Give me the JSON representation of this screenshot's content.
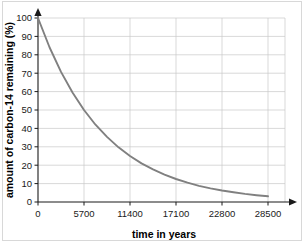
{
  "figure": {
    "background_color": "#ffffff",
    "frame_color": "#d8d8d8"
  },
  "chart_data": {
    "type": "line",
    "title": "",
    "subtitle": "",
    "xlabel": "time in years",
    "ylabel": "amount of carbon-14 remaining (%)",
    "xlim": [
      0,
      28500
    ],
    "ylim": [
      0,
      100
    ],
    "xticks": [
      0,
      5700,
      11400,
      17100,
      22800,
      28500
    ],
    "xtick_labels": [
      "0",
      "5700",
      "11400",
      "17100",
      "22800",
      "28500"
    ],
    "yticks": [
      0,
      10,
      20,
      30,
      40,
      50,
      60,
      70,
      80,
      90,
      100
    ],
    "ytick_labels": [
      "0",
      "10",
      "20",
      "30",
      "40",
      "50",
      "60",
      "70",
      "80",
      "90",
      "100"
    ],
    "grid": true,
    "grid_color": "#c9c9c9",
    "legend": false,
    "legend_position": "none",
    "series": [
      {
        "name": "carbon-14 remaining",
        "color": "#808080",
        "half_life_years": 5700,
        "x": [
          0,
          1425,
          2850,
          4275,
          5700,
          7125,
          8550,
          9975,
          11400,
          12825,
          14250,
          15675,
          17100,
          18525,
          19950,
          21375,
          22800,
          24225,
          25650,
          27075,
          28500
        ],
        "values": [
          100,
          84.1,
          70.7,
          59.5,
          50,
          42.0,
          35.4,
          29.7,
          25,
          21.0,
          17.7,
          14.9,
          12.5,
          10.5,
          8.8,
          7.4,
          6.25,
          5.3,
          4.4,
          3.7,
          3.1
        ]
      }
    ],
    "annotations": []
  }
}
